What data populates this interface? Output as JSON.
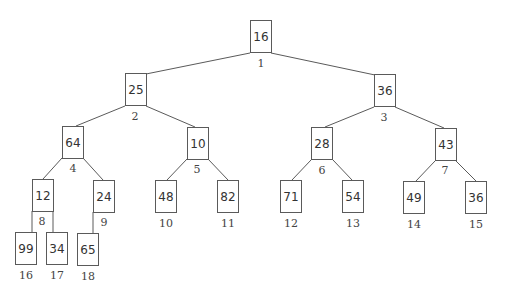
{
  "diagram": {
    "type": "binary-heap-tree",
    "colors": {
      "line": "#5a5a5a",
      "text": "#333333",
      "background": "#ffffff"
    },
    "nodes": [
      {
        "index": "1",
        "value": "16",
        "x": 250,
        "y": 20,
        "label_x": 261,
        "label_y": 57
      },
      {
        "index": "2",
        "value": "25",
        "x": 125,
        "y": 73,
        "label_x": 135,
        "label_y": 110
      },
      {
        "index": "3",
        "value": "36",
        "x": 374,
        "y": 74,
        "label_x": 384,
        "label_y": 111
      },
      {
        "index": "4",
        "value": "64",
        "x": 62,
        "y": 126,
        "label_x": 73,
        "label_y": 162
      },
      {
        "index": "5",
        "value": "10",
        "x": 187,
        "y": 127,
        "label_x": 197,
        "label_y": 163
      },
      {
        "index": "6",
        "value": "28",
        "x": 311,
        "y": 127,
        "label_x": 322,
        "label_y": 164
      },
      {
        "index": "7",
        "value": "43",
        "x": 435,
        "y": 128,
        "label_x": 445,
        "label_y": 164
      },
      {
        "index": "8",
        "value": "12",
        "x": 32,
        "y": 179,
        "label_x": 42,
        "label_y": 215
      },
      {
        "index": "9",
        "value": "24",
        "x": 93,
        "y": 180,
        "label_x": 104,
        "label_y": 216
      },
      {
        "index": "10",
        "value": "48",
        "x": 155,
        "y": 180,
        "label_x": 166,
        "label_y": 217
      },
      {
        "index": "11",
        "value": "82",
        "x": 217,
        "y": 180,
        "label_x": 228,
        "label_y": 217
      },
      {
        "index": "12",
        "value": "71",
        "x": 280,
        "y": 180,
        "label_x": 291,
        "label_y": 217
      },
      {
        "index": "13",
        "value": "54",
        "x": 342,
        "y": 180,
        "label_x": 353,
        "label_y": 217
      },
      {
        "index": "14",
        "value": "49",
        "x": 403,
        "y": 181,
        "label_x": 414,
        "label_y": 218
      },
      {
        "index": "15",
        "value": "36",
        "x": 465,
        "y": 181,
        "label_x": 476,
        "label_y": 218
      },
      {
        "index": "16",
        "value": "99",
        "x": 15,
        "y": 232,
        "label_x": 26,
        "label_y": 269
      },
      {
        "index": "17",
        "value": "34",
        "x": 46,
        "y": 232,
        "label_x": 57,
        "label_y": 269
      },
      {
        "index": "18",
        "value": "65",
        "x": 77,
        "y": 233,
        "label_x": 88,
        "label_y": 270
      }
    ],
    "edges": [
      {
        "from": "1",
        "to": "2",
        "x1": 250,
        "y1": 53,
        "x2": 146,
        "y2": 74
      },
      {
        "from": "1",
        "to": "3",
        "x1": 271,
        "y1": 53,
        "x2": 375,
        "y2": 75
      },
      {
        "from": "2",
        "to": "4",
        "x1": 125,
        "y1": 106,
        "x2": 76,
        "y2": 126
      },
      {
        "from": "2",
        "to": "5",
        "x1": 146,
        "y1": 106,
        "x2": 195,
        "y2": 127
      },
      {
        "from": "3",
        "to": "6",
        "x1": 374,
        "y1": 107,
        "x2": 325,
        "y2": 127
      },
      {
        "from": "3",
        "to": "7",
        "x1": 395,
        "y1": 107,
        "x2": 444,
        "y2": 128
      },
      {
        "from": "4",
        "to": "8",
        "x1": 62,
        "y1": 158,
        "x2": 43,
        "y2": 179
      },
      {
        "from": "4",
        "to": "9",
        "x1": 83,
        "y1": 158,
        "x2": 103,
        "y2": 180
      },
      {
        "from": "5",
        "to": "10",
        "x1": 187,
        "y1": 159,
        "x2": 167,
        "y2": 180
      },
      {
        "from": "5",
        "to": "11",
        "x1": 208,
        "y1": 159,
        "x2": 228,
        "y2": 180
      },
      {
        "from": "6",
        "to": "12",
        "x1": 311,
        "y1": 160,
        "x2": 292,
        "y2": 180
      },
      {
        "from": "6",
        "to": "13",
        "x1": 333,
        "y1": 160,
        "x2": 352,
        "y2": 180
      },
      {
        "from": "7",
        "to": "14",
        "x1": 435,
        "y1": 161,
        "x2": 416,
        "y2": 181
      },
      {
        "from": "7",
        "to": "15",
        "x1": 456,
        "y1": 161,
        "x2": 476,
        "y2": 181
      },
      {
        "from": "8",
        "to": "16",
        "x1": 32,
        "y1": 211,
        "x2": 32,
        "y2": 232
      },
      {
        "from": "8",
        "to": "17",
        "x1": 53,
        "y1": 211,
        "x2": 53,
        "y2": 232
      },
      {
        "from": "9",
        "to": "18",
        "x1": 93,
        "y1": 212,
        "x2": 93,
        "y2": 233
      }
    ]
  }
}
